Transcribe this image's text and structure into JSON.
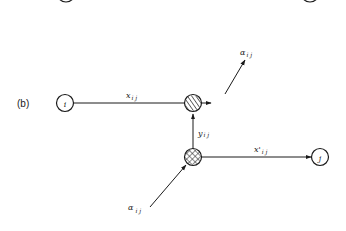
{
  "diagram": {
    "panel_label": "(b)",
    "colors": {
      "stroke": "#1a1a1a",
      "background": "#ffffff"
    },
    "nodes": [
      {
        "id": "i",
        "label": "i",
        "type": "open-circle"
      },
      {
        "id": "j",
        "label": "j",
        "type": "open-circle"
      },
      {
        "id": "split",
        "label": "",
        "type": "hatched-circle"
      },
      {
        "id": "merge",
        "label": "",
        "type": "crosshatched-circle"
      }
    ],
    "edges": [
      {
        "from": "i",
        "to": "split",
        "label_main": "x",
        "label_sub": "i j"
      },
      {
        "from": "split",
        "to": "out",
        "label_main": "α",
        "label_sub": "i j"
      },
      {
        "from": "merge",
        "to": "split",
        "label_main": "y",
        "label_sub": "i j"
      },
      {
        "from": "merge",
        "to": "j",
        "label_main": "x'",
        "label_sub": "i j"
      },
      {
        "from": "in",
        "to": "merge",
        "label_main": "α",
        "label_sub": "i j"
      }
    ]
  }
}
